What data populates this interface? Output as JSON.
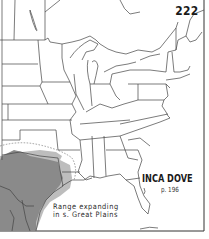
{
  "map": {
    "page_number": "222",
    "species": "INCA DOVE",
    "page_reference": "p. 196",
    "annotation_lines": [
      "Range expanding",
      "in s. Great Plains"
    ],
    "region": "Eastern United States",
    "colors": {
      "range_fill": "#8a8a8a",
      "range_light": "#bdbdbd",
      "border": "#444444",
      "expansion_dotted": "#9a9a9a",
      "background": "#ffffff"
    }
  }
}
